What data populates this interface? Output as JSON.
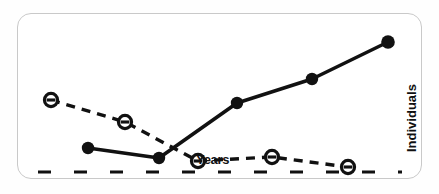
{
  "figure": {
    "panel_border_color": "#c9c9c9",
    "background_color": "#ffffff",
    "ink_color": "#111111"
  },
  "labels": {
    "xlabel": "Years",
    "ylabel": "Individuals"
  },
  "chart_data": {
    "type": "line",
    "title": "",
    "subtitle": "",
    "xlabel": "Years",
    "ylabel": "Individuals",
    "xlim": [
      0,
      6
    ],
    "ylim": [
      0,
      10
    ],
    "grid": false,
    "legend": "none",
    "axis_style": "dashed-baseline-only",
    "x_tick_labels": [],
    "y_tick_labels": [],
    "annotations": [],
    "x": [
      1,
      2,
      3,
      4,
      5
    ],
    "series": [
      {
        "name": "rising-series",
        "marker": "filled-circle",
        "linestyle": "solid",
        "color": "#111111",
        "values": [
          1.2,
          0.55,
          4.0,
          5.5,
          7.6
        ],
        "points_px": [
          {
            "x": 88,
            "y": 148
          },
          {
            "x": 159,
            "y": 158
          },
          {
            "x": 237,
            "y": 103
          },
          {
            "x": 312,
            "y": 79
          },
          {
            "x": 388,
            "y": 42
          }
        ]
      },
      {
        "name": "declining-series",
        "marker": "open-circle-with-bar",
        "linestyle": "dashed",
        "color": "#111111",
        "values": [
          4.4,
          3.3,
          0.45,
          0.6,
          0.1
        ],
        "points_px": [
          {
            "x": 51,
            "y": 100
          },
          {
            "x": 125,
            "y": 122
          },
          {
            "x": 198,
            "y": 161
          },
          {
            "x": 272,
            "y": 157
          },
          {
            "x": 348,
            "y": 167
          }
        ]
      }
    ],
    "baseline_px": {
      "y": 172,
      "x_start": 38,
      "x_end": 402,
      "dash": "13 23"
    }
  }
}
